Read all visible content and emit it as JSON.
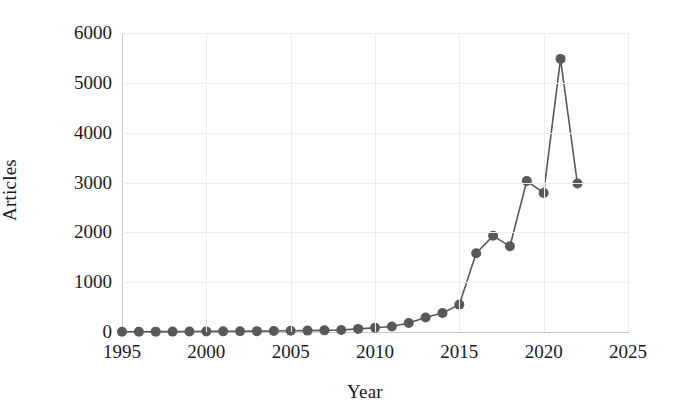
{
  "chart_data": {
    "type": "line",
    "title": "",
    "xlabel": "Year",
    "ylabel": "Articles",
    "xlim": [
      1995,
      2025
    ],
    "ylim": [
      0,
      6000
    ],
    "xticks": [
      1995,
      2000,
      2005,
      2010,
      2015,
      2020,
      2025
    ],
    "xtick_labels": [
      "1995",
      "2000",
      "2005",
      "2010",
      "2015",
      "2020",
      "2025"
    ],
    "yticks": [
      0,
      1000,
      2000,
      3000,
      4000,
      5000,
      6000
    ],
    "ytick_labels": [
      "0",
      "1000",
      "2000",
      "3000",
      "4000",
      "5000",
      "6000"
    ],
    "grid": true,
    "legend": "none",
    "marker": "circle",
    "line_color": "#595959",
    "marker_color": "#595959",
    "x": [
      1995,
      1996,
      1997,
      1998,
      1999,
      2000,
      2001,
      2002,
      2003,
      2004,
      2005,
      2006,
      2007,
      2008,
      2009,
      2010,
      2011,
      2012,
      2013,
      2014,
      2015,
      2016,
      2017,
      2018,
      2019,
      2020,
      2021,
      2022
    ],
    "values": [
      4,
      6,
      7,
      8,
      10,
      12,
      13,
      15,
      17,
      20,
      24,
      28,
      33,
      40,
      62,
      85,
      110,
      180,
      290,
      380,
      550,
      1580,
      1930,
      1720,
      3030,
      2790,
      5480,
      2980
    ],
    "categories": [
      "1995",
      "1996",
      "1997",
      "1998",
      "1999",
      "2000",
      "2001",
      "2002",
      "2003",
      "2004",
      "2005",
      "2006",
      "2007",
      "2008",
      "2009",
      "2010",
      "2011",
      "2012",
      "2013",
      "2014",
      "2015",
      "2016",
      "2017",
      "2018",
      "2019",
      "2020",
      "2021",
      "2022"
    ],
    "series": [
      {
        "name": "Articles",
        "values": [
          4,
          6,
          7,
          8,
          10,
          12,
          13,
          15,
          17,
          20,
          24,
          28,
          33,
          40,
          62,
          85,
          110,
          180,
          290,
          380,
          550,
          1580,
          1930,
          1720,
          3030,
          2790,
          5480,
          2980
        ]
      }
    ]
  },
  "colors": {
    "series": "#595959",
    "grid": "#ededed",
    "axis": "#c9c9c9",
    "text": "#1b1b1b",
    "background": "#ffffff"
  }
}
